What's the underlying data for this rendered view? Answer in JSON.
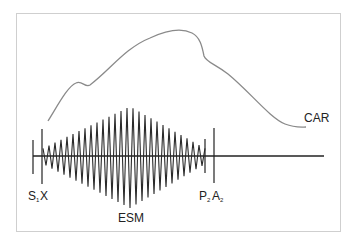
{
  "diagram": {
    "curve_label": "CAR",
    "murmur_label": "ESM",
    "markers": {
      "s1": {
        "letter": "S",
        "sub": "1"
      },
      "x": {
        "letter": "X"
      },
      "p2": {
        "letter": "P",
        "sub": "2"
      },
      "a2": {
        "letter": "A",
        "sub": "2"
      }
    },
    "colors": {
      "curve": "#8a8a8a",
      "signal": "#2a2a2a",
      "frame": "#cfcfcf"
    }
  }
}
